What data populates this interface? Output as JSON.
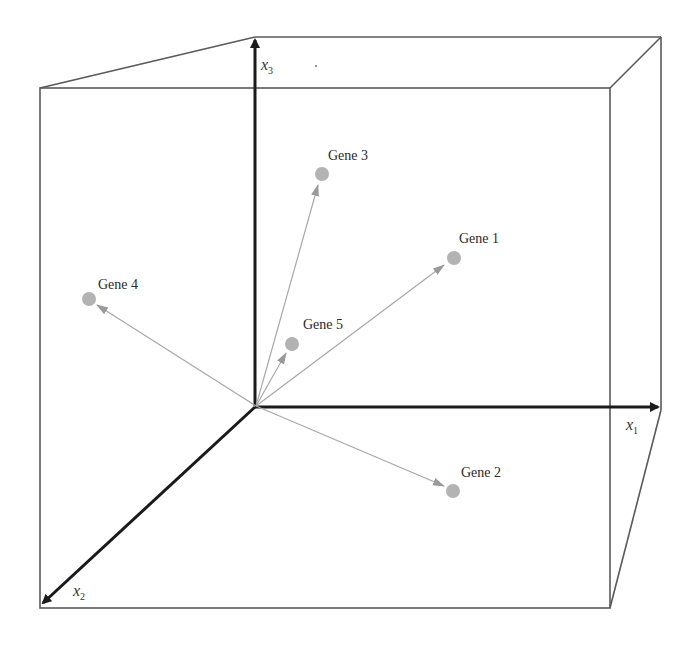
{
  "diagram": {
    "colors": {
      "box": "#5a5a5a",
      "axis": "#1a1a1a",
      "vector": "#a8a8a8",
      "point": "#b3b3b3",
      "text": "#2a2a2a"
    },
    "axes": [
      {
        "id": "x1",
        "base": "x",
        "sub": "1"
      },
      {
        "id": "x2",
        "base": "x",
        "sub": "2"
      },
      {
        "id": "x3",
        "base": "x",
        "sub": "3"
      }
    ],
    "genes": [
      {
        "label": "Gene 1"
      },
      {
        "label": "Gene 2"
      },
      {
        "label": "Gene 3"
      },
      {
        "label": "Gene 4"
      },
      {
        "label": "Gene 5"
      }
    ]
  }
}
